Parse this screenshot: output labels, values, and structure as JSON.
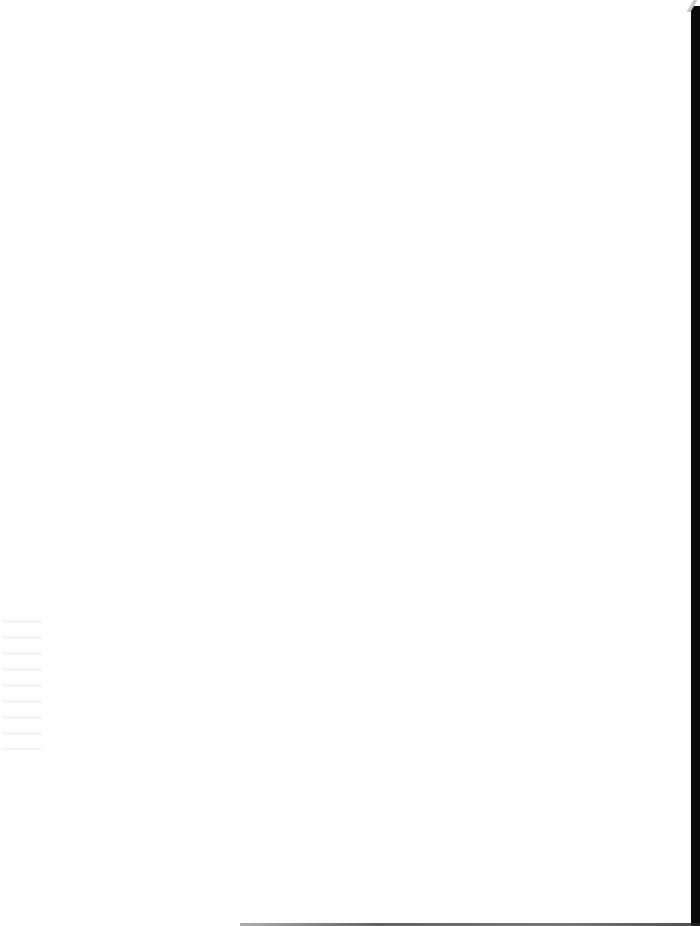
{
  "document": {
    "type": "scanned-page",
    "content": "",
    "is_blank": true
  },
  "colors": {
    "page": "#fefefe",
    "scan_border": "#0a0a0a"
  }
}
